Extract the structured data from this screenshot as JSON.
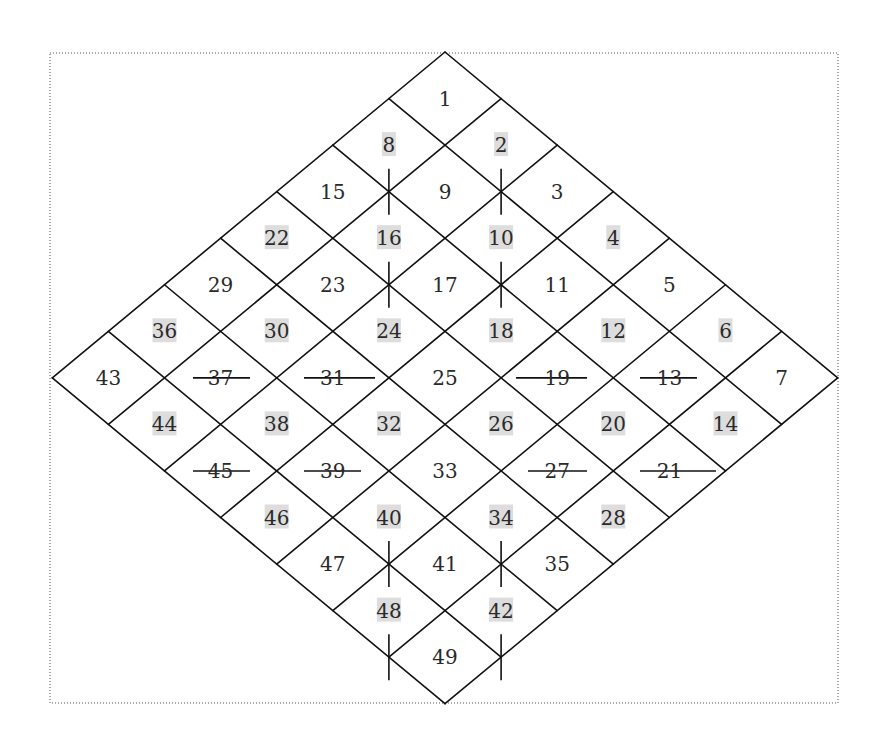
{
  "diagram": {
    "title": "",
    "grid_size": 7,
    "geometry": {
      "apex": [
        445,
        52
      ],
      "step_down_left": [
        -56.1,
        46.55
      ],
      "step_down_right": [
        56.1,
        46.55
      ]
    },
    "frame": {
      "x": 50,
      "y": 53,
      "width": 788,
      "height": 650,
      "style": "dotted"
    },
    "colors": {
      "line": "#111111",
      "text": "#2a2a2a",
      "highlight": "#dddddd",
      "background": "#ffffff"
    },
    "cells": [
      {
        "n": 1,
        "r": 0,
        "c": 0,
        "hl": false
      },
      {
        "n": 2,
        "r": 0,
        "c": 1,
        "hl": true
      },
      {
        "n": 3,
        "r": 0,
        "c": 2,
        "hl": false
      },
      {
        "n": 4,
        "r": 0,
        "c": 3,
        "hl": true
      },
      {
        "n": 5,
        "r": 0,
        "c": 4,
        "hl": false
      },
      {
        "n": 6,
        "r": 0,
        "c": 5,
        "hl": true
      },
      {
        "n": 7,
        "r": 0,
        "c": 6,
        "hl": false
      },
      {
        "n": 8,
        "r": 1,
        "c": 0,
        "hl": true
      },
      {
        "n": 9,
        "r": 1,
        "c": 1,
        "hl": false
      },
      {
        "n": 10,
        "r": 1,
        "c": 2,
        "hl": true
      },
      {
        "n": 11,
        "r": 1,
        "c": 3,
        "hl": false
      },
      {
        "n": 12,
        "r": 1,
        "c": 4,
        "hl": true
      },
      {
        "n": 13,
        "r": 1,
        "c": 5,
        "hl": false
      },
      {
        "n": 14,
        "r": 1,
        "c": 6,
        "hl": true
      },
      {
        "n": 15,
        "r": 2,
        "c": 0,
        "hl": false
      },
      {
        "n": 16,
        "r": 2,
        "c": 1,
        "hl": true
      },
      {
        "n": 17,
        "r": 2,
        "c": 2,
        "hl": false
      },
      {
        "n": 18,
        "r": 2,
        "c": 3,
        "hl": true
      },
      {
        "n": 19,
        "r": 2,
        "c": 4,
        "hl": false
      },
      {
        "n": 20,
        "r": 2,
        "c": 5,
        "hl": true
      },
      {
        "n": 21,
        "r": 2,
        "c": 6,
        "hl": false
      },
      {
        "n": 22,
        "r": 3,
        "c": 0,
        "hl": true
      },
      {
        "n": 23,
        "r": 3,
        "c": 1,
        "hl": false
      },
      {
        "n": 24,
        "r": 3,
        "c": 2,
        "hl": true
      },
      {
        "n": 25,
        "r": 3,
        "c": 3,
        "hl": false
      },
      {
        "n": 26,
        "r": 3,
        "c": 4,
        "hl": true
      },
      {
        "n": 27,
        "r": 3,
        "c": 5,
        "hl": false
      },
      {
        "n": 28,
        "r": 3,
        "c": 6,
        "hl": true
      },
      {
        "n": 29,
        "r": 4,
        "c": 0,
        "hl": false
      },
      {
        "n": 30,
        "r": 4,
        "c": 1,
        "hl": true
      },
      {
        "n": 31,
        "r": 4,
        "c": 2,
        "hl": false
      },
      {
        "n": 32,
        "r": 4,
        "c": 3,
        "hl": true
      },
      {
        "n": 33,
        "r": 4,
        "c": 4,
        "hl": false
      },
      {
        "n": 34,
        "r": 4,
        "c": 5,
        "hl": true
      },
      {
        "n": 35,
        "r": 4,
        "c": 6,
        "hl": false
      },
      {
        "n": 36,
        "r": 5,
        "c": 0,
        "hl": true
      },
      {
        "n": 37,
        "r": 5,
        "c": 1,
        "hl": false
      },
      {
        "n": 38,
        "r": 5,
        "c": 2,
        "hl": true
      },
      {
        "n": 39,
        "r": 5,
        "c": 3,
        "hl": false
      },
      {
        "n": 40,
        "r": 5,
        "c": 4,
        "hl": true
      },
      {
        "n": 41,
        "r": 5,
        "c": 5,
        "hl": false
      },
      {
        "n": 42,
        "r": 5,
        "c": 6,
        "hl": true
      },
      {
        "n": 43,
        "r": 6,
        "c": 0,
        "hl": false
      },
      {
        "n": 44,
        "r": 6,
        "c": 1,
        "hl": true
      },
      {
        "n": 45,
        "r": 6,
        "c": 2,
        "hl": false
      },
      {
        "n": 46,
        "r": 6,
        "c": 3,
        "hl": true
      },
      {
        "n": 47,
        "r": 6,
        "c": 4,
        "hl": false
      },
      {
        "n": 48,
        "r": 6,
        "c": 5,
        "hl": true
      },
      {
        "n": 49,
        "r": 6,
        "c": 6,
        "hl": false
      }
    ],
    "vertical_ticks": [
      {
        "node": [
          2,
          1
        ],
        "between": [
          8,
          16
        ],
        "half_length": 23
      },
      {
        "node": [
          1,
          2
        ],
        "between": [
          2,
          10
        ],
        "half_length": 23
      },
      {
        "node": [
          3,
          2
        ],
        "between": [
          16,
          24
        ],
        "half_length": 23
      },
      {
        "node": [
          2,
          3
        ],
        "between": [
          10,
          18
        ],
        "half_length": 23
      },
      {
        "node": [
          6,
          5
        ],
        "between": [
          32,
          40
        ],
        "half_length": 23
      },
      {
        "node": [
          5,
          6
        ],
        "between": [
          26,
          34
        ],
        "half_length": 23
      },
      {
        "node": [
          7,
          6
        ],
        "between": [
          40,
          48
        ],
        "half_length": 23
      },
      {
        "node": [
          6,
          7
        ],
        "between": [
          34,
          42
        ],
        "half_length": 23
      }
    ],
    "horizontal_ticks": [
      {
        "node": [
          6,
          1
        ],
        "between": [
          36,
          30
        ],
        "x1": 193,
        "x2": 250
      },
      {
        "node": [
          5,
          2
        ],
        "between": [
          30,
          24
        ],
        "x1": 304,
        "x2": 375
      },
      {
        "node": [
          3,
          4
        ],
        "between": [
          18,
          12
        ],
        "x1": 516,
        "x2": 587
      },
      {
        "node": [
          2,
          5
        ],
        "between": [
          12,
          6
        ],
        "x1": 640,
        "x2": 697
      },
      {
        "node": [
          7,
          2
        ],
        "between": [
          44,
          38
        ],
        "x1": 193,
        "x2": 250
      },
      {
        "node": [
          6,
          3
        ],
        "between": [
          38,
          32
        ],
        "x1": 304,
        "x2": 361
      },
      {
        "node": [
          4,
          5
        ],
        "between": [
          26,
          20
        ],
        "x1": 528,
        "x2": 587
      },
      {
        "node": [
          3,
          6
        ],
        "between": [
          20,
          14
        ],
        "x1": 640,
        "x2": 716
      }
    ]
  }
}
